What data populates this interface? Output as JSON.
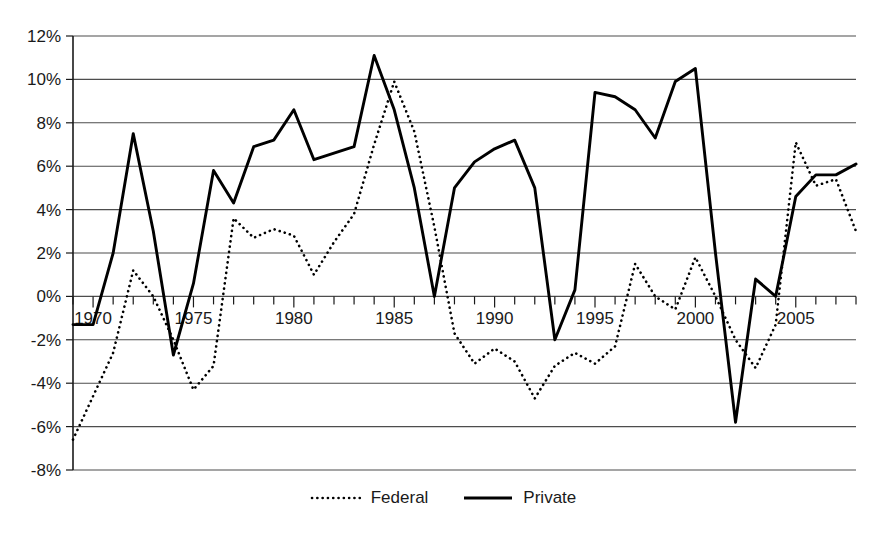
{
  "chart_data": {
    "type": "line",
    "title": "",
    "xlabel": "",
    "ylabel": "",
    "xlim": [
      1969,
      2008
    ],
    "ylim": [
      -8,
      12
    ],
    "ytick_values": [
      12,
      10,
      8,
      6,
      4,
      2,
      0,
      -2,
      -4,
      -6,
      -8
    ],
    "ytick_labels": [
      "12%",
      "10%",
      "8%",
      "6%",
      "4%",
      "2%",
      "0%",
      "-2%",
      "-4%",
      "-6%",
      "-8%"
    ],
    "xtick_values": [
      1970,
      1975,
      1980,
      1985,
      1990,
      1995,
      2000,
      2005
    ],
    "xtick_labels": [
      "1970",
      "1975",
      "1980",
      "1985",
      "1990",
      "1995",
      "2000",
      "2005"
    ],
    "xtick_minor_step": 1,
    "grid": "horizontal",
    "legend_position": "bottom-center",
    "x": [
      1969,
      1970,
      1971,
      1972,
      1973,
      1974,
      1975,
      1976,
      1977,
      1978,
      1979,
      1980,
      1981,
      1982,
      1983,
      1984,
      1985,
      1986,
      1987,
      1988,
      1989,
      1990,
      1991,
      1992,
      1993,
      1994,
      1995,
      1996,
      1997,
      1998,
      1999,
      2000,
      2001,
      2002,
      2003,
      2004,
      2005,
      2006,
      2007,
      2008
    ],
    "series": [
      {
        "name": "Federal",
        "style": "dotted",
        "color": "#000000",
        "values": [
          -6.6,
          -4.6,
          -2.6,
          1.2,
          0.0,
          -2.0,
          -4.3,
          -3.2,
          3.6,
          2.7,
          3.1,
          2.8,
          1.0,
          2.5,
          3.8,
          7.0,
          9.9,
          7.6,
          3.2,
          -1.7,
          -3.1,
          -2.4,
          -3.0,
          -4.7,
          -3.2,
          -2.6,
          -3.1,
          -2.3,
          1.5,
          0.0,
          -0.6,
          1.8,
          0.0,
          -2.0,
          -3.3,
          -1.3,
          7.1,
          5.1,
          5.4,
          3.0
        ]
      },
      {
        "name": "Private",
        "style": "solid",
        "color": "#000000",
        "values": [
          -1.3,
          -1.3,
          2.0,
          7.5,
          3.0,
          -2.7,
          0.6,
          5.8,
          4.3,
          6.9,
          7.2,
          8.6,
          6.3,
          6.6,
          6.9,
          11.1,
          8.6,
          5.0,
          0.0,
          5.0,
          6.2,
          6.8,
          7.2,
          5.0,
          -2.0,
          0.3,
          9.4,
          9.2,
          8.6,
          7.3,
          9.9,
          10.5,
          2.0,
          -5.8,
          0.8,
          0.0,
          4.6,
          5.6,
          5.6,
          6.1
        ]
      }
    ]
  },
  "legend": {
    "items": [
      {
        "label": "Federal",
        "style": "dotted"
      },
      {
        "label": "Private",
        "style": "solid"
      }
    ]
  }
}
